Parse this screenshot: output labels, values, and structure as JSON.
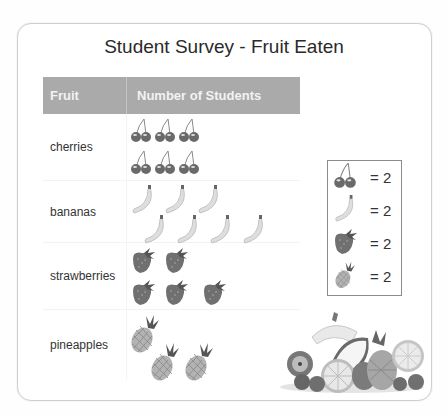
{
  "title": "Student Survey - Fruit Eaten",
  "table": {
    "headers": [
      "Fruit",
      "Number of Students"
    ],
    "rows": [
      {
        "fruit": "cherries",
        "icon": "cherry-icon",
        "icon_count": 6,
        "layout": [
          3,
          3
        ]
      },
      {
        "fruit": "bananas",
        "icon": "banana-icon",
        "icon_count": 7,
        "layout": [
          3,
          4
        ]
      },
      {
        "fruit": "strawberries",
        "icon": "strawberry-icon",
        "icon_count": 5,
        "layout": [
          2,
          3
        ]
      },
      {
        "fruit": "pineapples",
        "icon": "pineapple-icon",
        "icon_count": 3,
        "layout": [
          1,
          2
        ]
      }
    ]
  },
  "legend": {
    "items": [
      {
        "icon": "cherry-icon",
        "label": "= 2"
      },
      {
        "icon": "banana-icon",
        "label": "= 2"
      },
      {
        "icon": "strawberry-icon",
        "label": "= 2"
      },
      {
        "icon": "pineapple-icon",
        "label": "= 2"
      }
    ]
  },
  "chart_data": {
    "type": "table",
    "title": "Student Survey - Fruit Eaten",
    "xlabel": "Fruit",
    "ylabel": "Number of Students",
    "categories": [
      "cherries",
      "bananas",
      "strawberries",
      "pineapples"
    ],
    "icon_counts": [
      6,
      7,
      5,
      3
    ],
    "key": "each icon = 2 students",
    "values": [
      12,
      14,
      10,
      6
    ]
  }
}
